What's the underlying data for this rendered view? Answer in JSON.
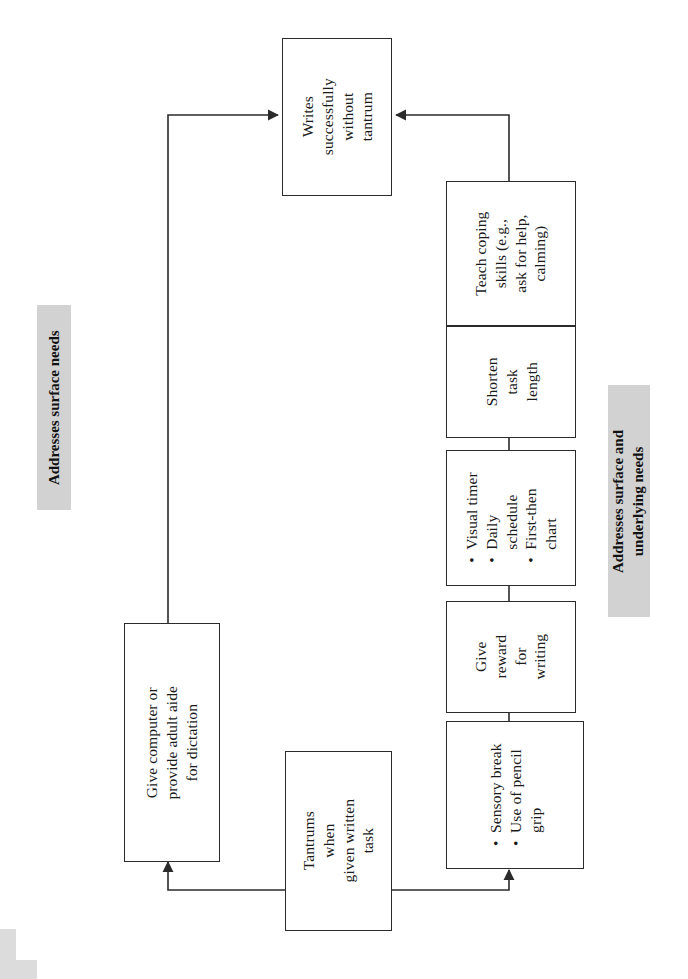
{
  "diagram": {
    "orientation": "rotated-90-ccw",
    "colors": {
      "box_border": "#2b2b2b",
      "box_fill": "#ffffff",
      "band_fill": "#d2d2d2",
      "text": "#1a1a1a",
      "connector": "#2b2b2b"
    },
    "bands": [
      {
        "id": "band-surface",
        "lines": [
          "Addresses surface needs"
        ]
      },
      {
        "id": "band-surface-underlying",
        "lines": [
          "Addresses surface and",
          "underlying  needs"
        ]
      }
    ],
    "nodes": [
      {
        "id": "outcome",
        "type": "plain",
        "lines": [
          "Writes",
          "successfully",
          "without",
          "tantrum"
        ]
      },
      {
        "id": "trigger",
        "type": "plain",
        "lines": [
          "Tantrums",
          "when",
          "given written",
          "task"
        ]
      },
      {
        "id": "dictation",
        "type": "plain",
        "lines": [
          "Give computer or",
          "provide adult aide",
          "for dictation"
        ]
      },
      {
        "id": "coping",
        "type": "plain",
        "lines": [
          "Teach coping",
          "skills (e.g.,",
          "ask for help,",
          "calming)"
        ]
      },
      {
        "id": "shorten",
        "type": "plain",
        "lines": [
          "Shorten",
          "task",
          "length"
        ]
      },
      {
        "id": "visual-supports",
        "type": "bulleted",
        "bullets": [
          [
            "Visual timer"
          ],
          [
            "Daily",
            "schedule"
          ],
          [
            "First-then",
            "chart"
          ]
        ]
      },
      {
        "id": "reward",
        "type": "plain",
        "lines": [
          "Give",
          "reward",
          "for",
          "writing"
        ]
      },
      {
        "id": "sensory",
        "type": "bulleted",
        "bullets": [
          [
            "Sensory break"
          ],
          [
            "Use of pencil",
            "grip"
          ]
        ]
      }
    ],
    "edges": [
      {
        "id": "edge-trigger-to-dictation",
        "from": "trigger",
        "to": "dictation",
        "arrow": true
      },
      {
        "id": "edge-dictation-to-outcome",
        "from": "dictation",
        "to": "outcome",
        "arrow": true
      },
      {
        "id": "edge-trigger-to-sensory",
        "from": "trigger",
        "to": "sensory",
        "arrow": true
      },
      {
        "id": "edge-sensory-to-reward",
        "from": "sensory",
        "to": "reward",
        "arrow": false
      },
      {
        "id": "edge-reward-to-visual",
        "from": "reward",
        "to": "visual-supports",
        "arrow": false
      },
      {
        "id": "edge-visual-to-shorten",
        "from": "visual-supports",
        "to": "shorten",
        "arrow": false
      },
      {
        "id": "edge-shorten-to-coping",
        "from": "shorten",
        "to": "coping",
        "arrow": false
      },
      {
        "id": "edge-coping-to-outcome",
        "from": "coping",
        "to": "outcome",
        "arrow": true
      }
    ]
  }
}
